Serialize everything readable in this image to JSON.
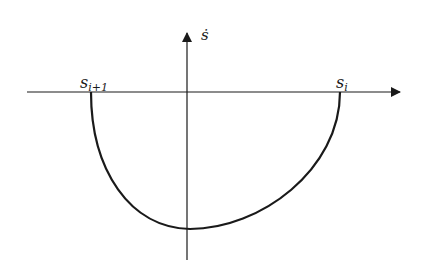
{
  "diagram": {
    "type": "phase-plane-trajectory",
    "y_axis_label": "ṡ",
    "x_marks": [
      {
        "label_base": "s",
        "label_sub": "i+1",
        "position": "left"
      },
      {
        "label_base": "s",
        "label_sub": "i",
        "position": "right"
      }
    ],
    "curve": "semi-elliptical arc below x-axis from s_i to s_i+1",
    "colors": {
      "stroke": "#1a1a1a",
      "background": "#ffffff"
    }
  }
}
